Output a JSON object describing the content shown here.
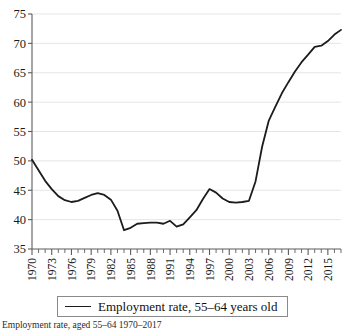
{
  "chart_data": {
    "type": "line",
    "title": "",
    "xlabel": "",
    "ylabel": "",
    "xlim": [
      1970,
      2017
    ],
    "ylim": [
      35,
      75
    ],
    "yticks": [
      35,
      40,
      45,
      50,
      55,
      60,
      65,
      70,
      75
    ],
    "xticks": [
      1970,
      1973,
      1976,
      1979,
      1982,
      1985,
      1988,
      1991,
      1994,
      1997,
      2000,
      2003,
      2006,
      2009,
      2012,
      2015
    ],
    "grid": "horizontal",
    "legend_position": "below-axis",
    "line_color": "#1c1c1c",
    "grid_color": "#e2e2e2",
    "axis_color": "#5c5c5c",
    "series": [
      {
        "name": "Employment rate, 55–64 years old",
        "x": [
          1970,
          1971,
          1972,
          1973,
          1974,
          1975,
          1976,
          1977,
          1978,
          1979,
          1980,
          1981,
          1982,
          1983,
          1984,
          1985,
          1986,
          1987,
          1988,
          1989,
          1990,
          1991,
          1992,
          1993,
          1994,
          1995,
          1996,
          1997,
          1998,
          1999,
          2000,
          2001,
          2002,
          2003,
          2004,
          2005,
          2006,
          2007,
          2008,
          2009,
          2010,
          2011,
          2012,
          2013,
          2014,
          2015,
          2016,
          2017
        ],
        "values": [
          50.2,
          48.4,
          46.6,
          45.2,
          44.0,
          43.3,
          43.0,
          43.2,
          43.7,
          44.2,
          44.5,
          44.2,
          43.4,
          41.5,
          38.2,
          38.6,
          39.3,
          39.4,
          39.5,
          39.5,
          39.3,
          39.8,
          38.8,
          39.2,
          40.4,
          41.6,
          43.5,
          45.2,
          44.6,
          43.6,
          43.0,
          42.9,
          43.0,
          43.2,
          46.5,
          52.4,
          56.8,
          59.2,
          61.5,
          63.4,
          65.2,
          66.8,
          68.1,
          69.4,
          69.6,
          70.4,
          71.5,
          72.3
        ]
      }
    ]
  },
  "legend": {
    "entries": [
      {
        "label": "Employment rate, 55–64 years old",
        "swatch": "line"
      }
    ]
  },
  "caption": {
    "text": "Employment rate, aged 55–64 1970–2017"
  },
  "axes": {
    "y": {
      "labels": [
        "75",
        "70",
        "65",
        "60",
        "55",
        "50",
        "45",
        "40",
        "35"
      ]
    },
    "x": {
      "labels": [
        "1970",
        "1973",
        "1976",
        "1979",
        "1982",
        "1985",
        "1988",
        "1991",
        "1994",
        "1997",
        "2000",
        "2003",
        "2006",
        "2009",
        "2012",
        "2015"
      ]
    }
  }
}
